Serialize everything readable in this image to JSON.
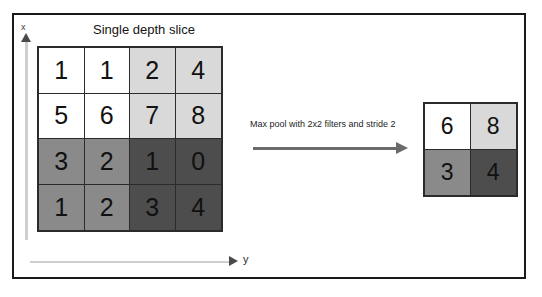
{
  "figure": {
    "title": "Single depth slice",
    "axes": {
      "x_label": "x",
      "y_label": "y"
    },
    "transform_caption": "Max pool with 2x2 filters and stride 2"
  },
  "colors": {
    "quadrant_top_left": "#ffffff",
    "quadrant_top_right": "#d9d9d9",
    "quadrant_bottom_left": "#8a8a8a",
    "quadrant_bottom_right": "#4d4d4d",
    "grid_line": "#2b2b2b",
    "frame": "#1a1a1a",
    "arrow": "#6b6b6b",
    "axis": "#cfcfcf"
  },
  "input_grid": {
    "rows": 4,
    "cols": 4,
    "cells": [
      {
        "value": "1",
        "fill": "#ffffff"
      },
      {
        "value": "1",
        "fill": "#ffffff"
      },
      {
        "value": "2",
        "fill": "#d9d9d9"
      },
      {
        "value": "4",
        "fill": "#d9d9d9"
      },
      {
        "value": "5",
        "fill": "#ffffff"
      },
      {
        "value": "6",
        "fill": "#ffffff"
      },
      {
        "value": "7",
        "fill": "#d9d9d9"
      },
      {
        "value": "8",
        "fill": "#d9d9d9"
      },
      {
        "value": "3",
        "fill": "#8a8a8a"
      },
      {
        "value": "2",
        "fill": "#8a8a8a"
      },
      {
        "value": "1",
        "fill": "#4d4d4d"
      },
      {
        "value": "0",
        "fill": "#4d4d4d"
      },
      {
        "value": "1",
        "fill": "#8a8a8a"
      },
      {
        "value": "2",
        "fill": "#8a8a8a"
      },
      {
        "value": "3",
        "fill": "#4d4d4d"
      },
      {
        "value": "4",
        "fill": "#4d4d4d"
      }
    ]
  },
  "output_grid": {
    "rows": 2,
    "cols": 2,
    "cells": [
      {
        "value": "6",
        "fill": "#ffffff"
      },
      {
        "value": "8",
        "fill": "#d9d9d9"
      },
      {
        "value": "3",
        "fill": "#8a8a8a"
      },
      {
        "value": "4",
        "fill": "#4d4d4d"
      }
    ]
  }
}
